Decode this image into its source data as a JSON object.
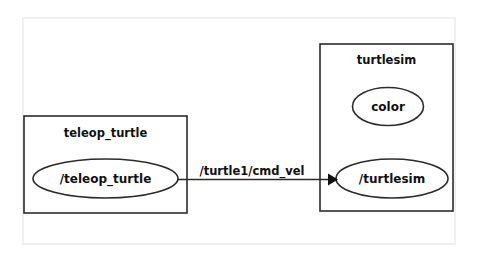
{
  "canvas": {
    "width": 478,
    "height": 262,
    "background_color": "#ffffff",
    "frame_color": "#f1efef",
    "stroke_color": "#2b2b2b",
    "text_color": "#101010"
  },
  "graph": {
    "groups": [
      {
        "id": "group-teleop-turtle",
        "label": "teleop_turtle",
        "nodes": [
          {
            "id": "node-teleop-turtle",
            "label": "/teleop_turtle"
          }
        ]
      },
      {
        "id": "group-turtlesim",
        "label": "turtlesim",
        "nodes": [
          {
            "id": "node-color",
            "label": "color"
          },
          {
            "id": "node-turtlesim",
            "label": "/turtlesim"
          }
        ]
      }
    ],
    "edges": [
      {
        "id": "edge-cmd-vel",
        "label": "/turtle1/cmd_vel",
        "from": "/teleop_turtle",
        "to": "/turtlesim",
        "arrow": "arrow-head-icon"
      }
    ]
  }
}
